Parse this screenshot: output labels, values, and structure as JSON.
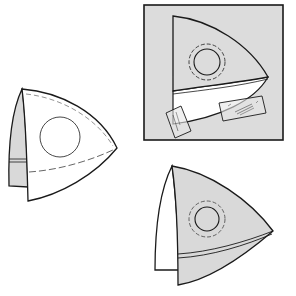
{
  "diagram": {
    "type": "sewing-pattern-illustration",
    "colors": {
      "background": "#ffffff",
      "fabric_gray": "#d9d9d9",
      "panel_gray": "#dcdcdc",
      "line": "#1a1a1a",
      "dashed_line": "#555555",
      "tape": "#e6e6e6"
    },
    "figures": [
      {
        "id": "left-piece",
        "description": "Rounded triangular fabric piece with folded gray side flap, circle marking and dashed seam line"
      },
      {
        "id": "top-right-panel",
        "description": "Piece laid on gray square background, circle with dashed outline, white lower band held with two strips of tape"
      },
      {
        "id": "bottom-right-piece",
        "description": "Gray triangular piece with circle and dashed ring, double stitched band, white side flap"
      }
    ]
  }
}
